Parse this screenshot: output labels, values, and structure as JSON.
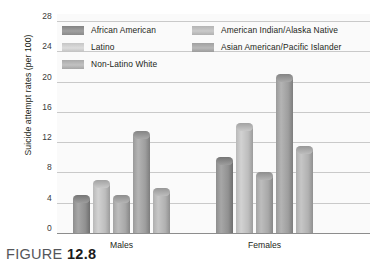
{
  "figure": {
    "label": "FIGURE",
    "number": "12.8"
  },
  "chart_data": {
    "type": "bar",
    "title": "",
    "xlabel": "",
    "ylabel": "Suicide attempt rates (per 100)",
    "ylim": [
      0,
      28
    ],
    "yticks": [
      28,
      24,
      20,
      16,
      12,
      8,
      4,
      0
    ],
    "grid": true,
    "legend_position": "top-inside",
    "categories": [
      "Males",
      "Females"
    ],
    "series": [
      {
        "name": "African American",
        "values": [
          5,
          10
        ]
      },
      {
        "name": "Latino",
        "values": [
          7,
          14.5
        ]
      },
      {
        "name": "Non-Latino White",
        "values": [
          5,
          8
        ]
      },
      {
        "name": "American Indian/Alaska Native",
        "values": [
          13.5,
          21
        ]
      },
      {
        "name": "Asian American/Pacific Islander",
        "values": [
          6,
          11.5
        ]
      }
    ]
  }
}
